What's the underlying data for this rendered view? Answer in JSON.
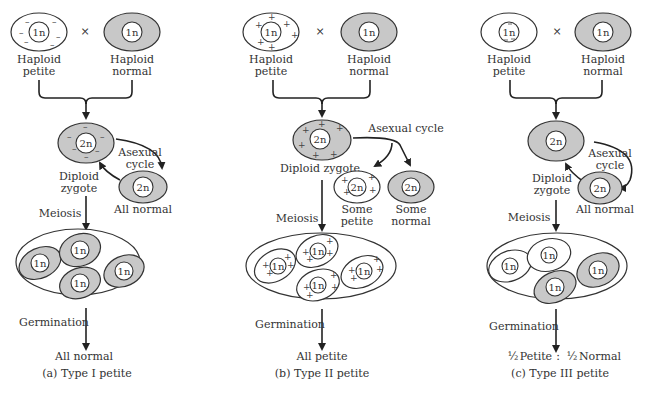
{
  "panels": [
    {
      "id": "a",
      "cross_symbol": "×",
      "parent_petite": {
        "label_line1": "Haploid",
        "label_line2": "petite",
        "nucleus": "1n",
        "marker": "−"
      },
      "parent_normal": {
        "label_line1": "Haploid",
        "label_line2": "normal",
        "nucleus": "1n"
      },
      "zygote": {
        "label_line1": "Diploid",
        "label_line2": "zygote",
        "nucleus": "2n"
      },
      "asexual": {
        "label_line1": "Asexual",
        "label_line2": "cycle",
        "result_nucleus": "2n",
        "result_label": "All normal"
      },
      "meiosis_label": "Meiosis",
      "tetrad_nuclei": [
        "1n",
        "1n",
        "1n",
        "1n"
      ],
      "germination_label": "Germination",
      "outcome": "All normal",
      "caption": "(a)  Type I petite"
    },
    {
      "id": "b",
      "cross_symbol": "×",
      "parent_petite": {
        "label_line1": "Haploid",
        "label_line2": "petite",
        "nucleus": "1n",
        "marker": "+"
      },
      "parent_normal": {
        "label_line1": "Haploid",
        "label_line2": "normal",
        "nucleus": "1n"
      },
      "zygote": {
        "label": "Diploid zygote",
        "nucleus": "2n"
      },
      "asexual": {
        "label": "Asexual cycle",
        "result_petite": {
          "nucleus": "2n",
          "label_line1": "Some",
          "label_line2": "petite"
        },
        "result_normal": {
          "nucleus": "2n",
          "label_line1": "Some",
          "label_line2": "normal"
        }
      },
      "meiosis_label": "Meiosis",
      "tetrad_nuclei": [
        "1n",
        "1n",
        "1n",
        "1n"
      ],
      "germination_label": "Germination",
      "outcome": "All petite",
      "caption": "(b)   Type II petite"
    },
    {
      "id": "c",
      "cross_symbol": "×",
      "parent_petite": {
        "label_line1": "Haploid",
        "label_line2": "petite",
        "nucleus": "1n",
        "marker": "nuclear −"
      },
      "parent_normal": {
        "label_line1": "Haploid",
        "label_line2": "normal",
        "nucleus": "1n"
      },
      "zygote": {
        "label_line1": "Diploid",
        "label_line2": "zygote",
        "nucleus": "2n"
      },
      "asexual": {
        "label_line1": "Asexual",
        "label_line2": "cycle",
        "result_nucleus": "2n",
        "result_label": "All normal"
      },
      "meiosis_label": "Meiosis",
      "tetrad_nuclei": [
        "1n",
        "1n",
        "1n",
        "1n"
      ],
      "germination_label": "Germination",
      "outcome": {
        "petite_fraction": "½",
        "petite_label": "Petite",
        "separator": ":",
        "normal_fraction": "½",
        "normal_label": "Normal"
      },
      "caption": "(c)  Type III petite"
    }
  ],
  "colors": {
    "normal_cytoplasm": "#c8c8c8",
    "petite_cytoplasm": "#ffffff",
    "stroke": "#333333"
  }
}
